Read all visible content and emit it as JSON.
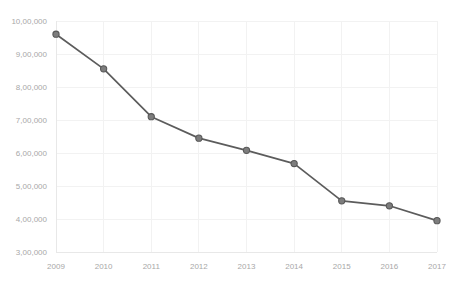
{
  "chart_data": {
    "type": "line",
    "title": "",
    "subtitle": "",
    "xlabel": "",
    "ylabel": "",
    "x": [
      2009,
      2010,
      2011,
      2012,
      2013,
      2014,
      2015,
      2016,
      2017
    ],
    "categories": [
      "2009",
      "2010",
      "2011",
      "2012",
      "2013",
      "2014",
      "2015",
      "2016",
      "2017"
    ],
    "values": [
      960000,
      855000,
      710000,
      645000,
      608000,
      568000,
      455000,
      440000,
      395000
    ],
    "series": [
      {
        "name": "",
        "values": [
          960000,
          855000,
          710000,
          645000,
          608000,
          568000,
          455000,
          440000,
          395000
        ]
      }
    ],
    "ylim": [
      300000,
      1000000
    ],
    "xlim": [
      2009,
      2017
    ],
    "yticks": [
      300000,
      400000,
      500000,
      600000,
      700000,
      800000,
      900000,
      1000000
    ],
    "ytick_labels": [
      "3,00,000",
      "4,00,000",
      "5,00,000",
      "6,00,000",
      "7,00,000",
      "8,00,000",
      "9,00,000",
      "10,00,000"
    ],
    "xticks": [
      2009,
      2010,
      2011,
      2012,
      2013,
      2014,
      2015,
      2016,
      2017
    ],
    "xtick_labels": [
      "2009",
      "2010",
      "2011",
      "2012",
      "2013",
      "2014",
      "2015",
      "2016",
      "2017"
    ],
    "grid": true,
    "grid_x": true,
    "grid_y": true,
    "legend": false,
    "legend_position": "none",
    "number_format": "indian",
    "marker": "circle",
    "colors": {
      "line": "#5c5c5c",
      "marker_fill": "#7d7d7d",
      "marker_stroke": "#585858",
      "grid": "#f2f2f2",
      "axis": "#e8e8e8",
      "tick_text": "#a8a8a8",
      "background": "#ffffff"
    }
  }
}
